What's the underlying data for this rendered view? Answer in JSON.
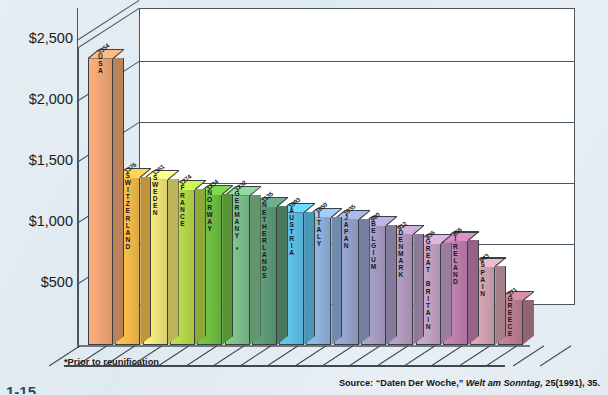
{
  "figure": {
    "footnote": "*Prior to reunification",
    "source_prefix": "Source:",
    "source_title": "“Daten Der Woche,”",
    "source_journal": "Welt am Sonntag,",
    "source_citation": "25(1991), 35.",
    "fig_number": "1-15"
  },
  "chart_data": {
    "type": "bar",
    "title": "",
    "xlabel": "",
    "ylabel": "",
    "ylim": [
      0,
      2700
    ],
    "grid": true,
    "legend": "none",
    "yticks": [
      "$500",
      "$1,000",
      "$1,500",
      "$2,000",
      "$2,500"
    ],
    "ytick_values": [
      500,
      1000,
      1500,
      2000,
      2500
    ],
    "categories": [
      "USA",
      "SWITZERLAND",
      "SWEDEN",
      "FRANCE",
      "NORWAY",
      "GERMANY *",
      "NETHERLANDS",
      "AUSTRIA",
      "ITALY",
      "JAPAN",
      "BELGIUM",
      "DENMARK",
      "GREAT BRITAIN",
      "IRELAND",
      "SPAIN",
      "GREECE"
    ],
    "values": [
      2354,
      1376,
      1361,
      1274,
      1234,
      1232,
      1135,
      1093,
      1050,
      1035,
      980,
      912,
      836,
      856,
      643,
      371
    ],
    "colors": [
      "#efa675",
      "#f5bd4a",
      "#f2e879",
      "#b6d94a",
      "#6fbf43",
      "#7dc18c",
      "#5f9b78",
      "#5ec0e8",
      "#8fb4dd",
      "#96a3ce",
      "#a99ec6",
      "#b59cc2",
      "#c3a3c4",
      "#c07fae",
      "#d2a5b2",
      "#bd7f92"
    ],
    "bars": [
      {
        "label": "USA",
        "value": 2354,
        "color": "#efa675"
      },
      {
        "label": "SWITZERLAND",
        "value": 1376,
        "color": "#f5bd4a"
      },
      {
        "label": "SWEDEN",
        "value": 1361,
        "color": "#f2e879"
      },
      {
        "label": "FRANCE",
        "value": 1274,
        "color": "#b6d94a"
      },
      {
        "label": "NORWAY",
        "value": 1234,
        "color": "#6fbf43"
      },
      {
        "label": "GERMANY *",
        "value": 1232,
        "color": "#7dc18c"
      },
      {
        "label": "NETHERLANDS",
        "value": 1135,
        "color": "#5f9b78"
      },
      {
        "label": "AUSTRIA",
        "value": 1093,
        "color": "#5ec0e8"
      },
      {
        "label": "ITALY",
        "value": 1050,
        "color": "#8fb4dd"
      },
      {
        "label": "JAPAN",
        "value": 1035,
        "color": "#96a3ce"
      },
      {
        "label": "BELGIUM",
        "value": 980,
        "color": "#a99ec6"
      },
      {
        "label": "DENMARK",
        "value": 912,
        "color": "#b59cc2"
      },
      {
        "label": "GREAT BRITAIN",
        "value": 836,
        "color": "#c3a3c4"
      },
      {
        "label": "IRELAND",
        "value": 856,
        "color": "#c07fae"
      },
      {
        "label": "SPAIN",
        "value": 643,
        "color": "#d2a5b2"
      },
      {
        "label": "GREECE",
        "value": 371,
        "color": "#bd7f92"
      }
    ]
  }
}
